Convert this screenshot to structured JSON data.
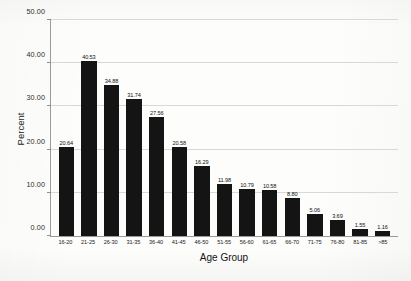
{
  "chart_data": {
    "type": "bar",
    "title": "",
    "xlabel": "Age Group",
    "ylabel": "Percent",
    "categories": [
      "16-20",
      "21-25",
      "26-30",
      "31-35",
      "36-40",
      "41-45",
      "46-50",
      "51-55",
      "56-60",
      "61-65",
      "66-70",
      "71-75",
      "76-80",
      "81-85",
      ">85"
    ],
    "values": [
      20.64,
      40.53,
      34.88,
      31.74,
      27.56,
      20.58,
      16.29,
      11.98,
      10.79,
      10.58,
      8.8,
      5.06,
      3.69,
      1.55,
      1.16
    ],
    "value_labels": [
      "20.64",
      "40.53",
      "34.88",
      "31.74",
      "27.56",
      "20.58",
      "16.29",
      "11.98",
      "10.79",
      "10.58",
      "8.80",
      "5.06",
      "3.69",
      "1.55",
      "1.16"
    ],
    "ylim": [
      0,
      50
    ],
    "ytick_values": [
      0,
      10,
      20,
      30,
      40,
      50
    ],
    "ytick_labels": [
      "0.00",
      "10.00",
      "20.00",
      "30.00",
      "40.00",
      "50.00"
    ],
    "grid": true,
    "legend": "none",
    "bar_color": "#141414",
    "grid_color": "#d8d8d8",
    "axis_color": "#9a9a9a"
  }
}
